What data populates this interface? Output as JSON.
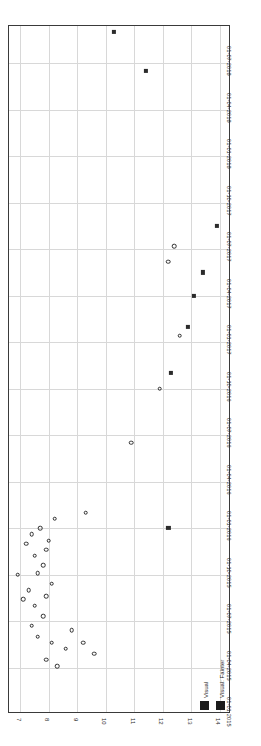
{
  "chart_data": {
    "type": "scatter",
    "title": "",
    "xlabel": "",
    "ylabel": "",
    "orientation": "rotated-90",
    "grid": true,
    "legend_position": "bottom-right-inside",
    "x_axis": {
      "name": "magnitude",
      "ticks": [
        "7",
        "8",
        "9",
        "10",
        "11",
        "12",
        "13",
        "14"
      ],
      "values": [
        7,
        8,
        9,
        10,
        11,
        12,
        13,
        14
      ],
      "min": 6.6,
      "max": 14.4,
      "inverted": false
    },
    "y_axis": {
      "name": "date",
      "ticks": [
        "01-07-2018",
        "01-04-2018",
        "01-01-2018",
        "01-10-2017",
        "01-07-2017",
        "01-04-2017",
        "01-01-2017",
        "01-10-2016",
        "01-07-2016",
        "01-04-2016",
        "01-01-2016",
        "01-10-2015",
        "01-07-2015",
        "01-04-2015",
        "01-01-2015"
      ],
      "min": "01-01-2015",
      "max": "01-09-2018"
    },
    "series": [
      {
        "name": "Visual",
        "marker": "open-circle",
        "color": "#2e2e2e",
        "points": [
          [
            7.9,
            3.5
          ],
          [
            8.3,
            3.1
          ],
          [
            8.1,
            4.6
          ],
          [
            8.6,
            4.2
          ],
          [
            7.6,
            5.0
          ],
          [
            7.4,
            5.7
          ],
          [
            7.8,
            6.3
          ],
          [
            8.8,
            5.4
          ],
          [
            9.2,
            4.6
          ],
          [
            9.6,
            3.9
          ],
          [
            7.1,
            7.4
          ],
          [
            7.5,
            7.0
          ],
          [
            7.3,
            8.0
          ],
          [
            7.9,
            7.6
          ],
          [
            8.1,
            8.4
          ],
          [
            7.6,
            9.1
          ],
          [
            7.8,
            9.6
          ],
          [
            7.5,
            10.2
          ],
          [
            7.9,
            10.6
          ],
          [
            8.0,
            11.2
          ],
          [
            6.9,
            9.0
          ],
          [
            7.2,
            11.0
          ],
          [
            7.4,
            11.6
          ],
          [
            7.7,
            12.0
          ],
          [
            8.2,
            12.6
          ],
          [
            9.3,
            13.0
          ],
          [
            10.9,
            17.5
          ],
          [
            11.9,
            21.0
          ],
          [
            12.6,
            24.4
          ],
          [
            12.2,
            29.2
          ],
          [
            12.4,
            30.2
          ],
          [
            14.0,
            46.0
          ],
          [
            13.6,
            48.5
          ],
          [
            13.0,
            51.2
          ],
          [
            13.2,
            51.8
          ],
          [
            13.3,
            53.0
          ],
          [
            12.7,
            56.5
          ],
          [
            12.4,
            57.5
          ],
          [
            12.1,
            58.5
          ],
          [
            11.9,
            60.5
          ],
          [
            11.6,
            62.5
          ],
          [
            11.8,
            63.5
          ],
          [
            11.5,
            64.5
          ],
          [
            11.2,
            65.8
          ],
          [
            11.3,
            67.0
          ],
          [
            10.8,
            69.5
          ],
          [
            11.0,
            70.5
          ],
          [
            10.4,
            73.0
          ],
          [
            10.6,
            74.0
          ],
          [
            10.9,
            75.5
          ],
          [
            10.1,
            78.5
          ],
          [
            10.2,
            80.0
          ],
          [
            10.0,
            81.5
          ],
          [
            9.7,
            83.0
          ],
          [
            9.8,
            84.5
          ],
          [
            9.4,
            86.5
          ],
          [
            9.5,
            88.0
          ],
          [
            9.2,
            90.0
          ],
          [
            9.3,
            91.5
          ],
          [
            8.9,
            93.5
          ],
          [
            9.0,
            95.0
          ],
          [
            8.7,
            97.0
          ],
          [
            8.8,
            98.5
          ],
          [
            8.4,
            101.0
          ],
          [
            8.5,
            102.5
          ],
          [
            8.2,
            105.0
          ],
          [
            8.3,
            106.5
          ],
          [
            8.0,
            109.0
          ],
          [
            8.1,
            110.0
          ],
          [
            7.8,
            113.0
          ],
          [
            7.9,
            114.5
          ],
          [
            7.5,
            118.0
          ],
          [
            7.7,
            119.5
          ],
          [
            7.4,
            122.0
          ],
          [
            7.6,
            123.5
          ]
        ]
      },
      {
        "name": "Visual: Fainter",
        "marker": "filled-square",
        "color": "#2b2b2b",
        "points": [
          [
            12.3,
            22.0
          ],
          [
            12.9,
            25.0
          ],
          [
            13.1,
            27.0
          ],
          [
            13.4,
            28.5
          ],
          [
            13.9,
            31.5
          ],
          [
            10.3,
            44.0
          ],
          [
            11.4,
            41.5
          ],
          [
            12.2,
            12.0
          ]
        ]
      }
    ]
  },
  "legend": {
    "entries": [
      {
        "label": "Visual",
        "marker": "filled-square",
        "color": "#1b1b1b"
      },
      {
        "label": "Visual: Fainter",
        "marker": "filled-square",
        "color": "#1b1b1b"
      }
    ]
  },
  "axes": {
    "date_ticks": [
      "01-07-2018",
      "01-04-2018",
      "01-01-2018",
      "01-10-2017",
      "01-07-2017",
      "01-04-2017",
      "01-01-2017",
      "01-10-2016",
      "01-07-2016",
      "01-04-2016",
      "01-01-2016",
      "01-10-2015",
      "01-07-2015",
      "01-04-2015",
      "01-01-2015"
    ],
    "magnitude_ticks": [
      "7",
      "8",
      "9",
      "10",
      "11",
      "12",
      "13",
      "14"
    ]
  }
}
